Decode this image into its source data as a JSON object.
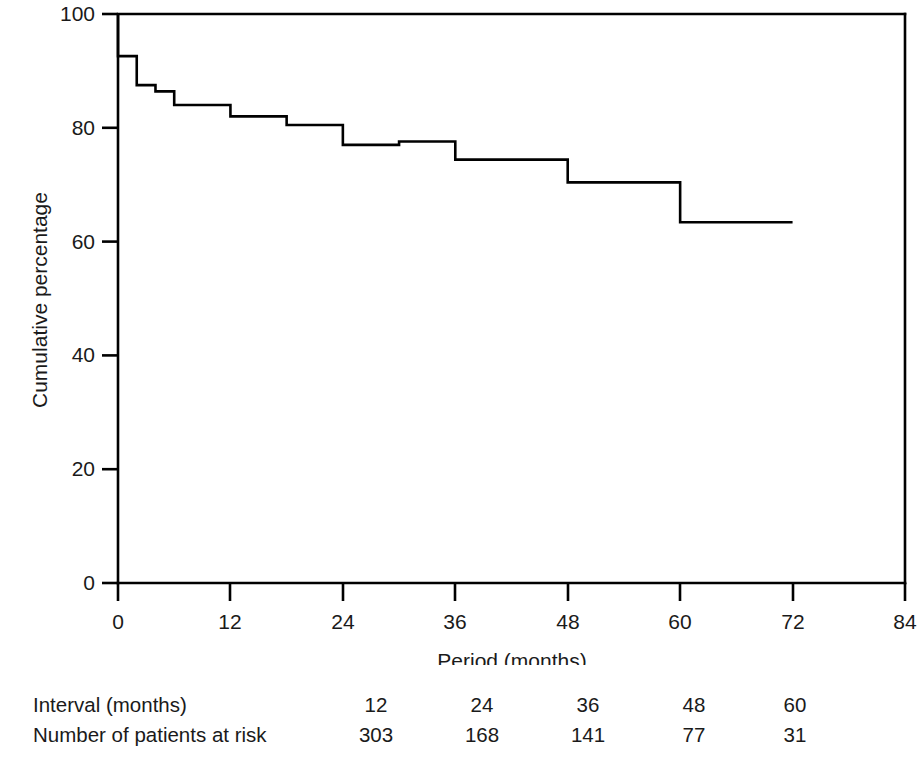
{
  "chart_data": {
    "type": "line",
    "subtype": "kaplan-meier-step",
    "title": "",
    "xlabel": "Period (months)",
    "ylabel": "Cumulative percentage",
    "xlim": [
      0,
      84
    ],
    "ylim": [
      0,
      100
    ],
    "xticks": [
      0,
      12,
      24,
      36,
      48,
      60,
      72,
      84
    ],
    "xtick_labels": [
      "0",
      "12",
      "24",
      "36",
      "48",
      "60",
      "72",
      "84"
    ],
    "yticks": [
      0,
      20,
      40,
      60,
      80,
      100
    ],
    "ytick_labels": [
      "0",
      "20",
      "40",
      "60",
      "80",
      "100"
    ],
    "grid": false,
    "legend": null,
    "line_color": "#000000",
    "line_width": 2.6,
    "series": [
      {
        "name": "Cumulative percentage",
        "step": "post",
        "x": [
          0,
          0,
          2,
          4,
          6,
          9,
          12,
          17,
          19,
          24,
          30,
          33,
          36,
          40,
          48,
          53,
          60,
          72
        ],
        "y": [
          100,
          92.6,
          92.6,
          87.5,
          87.5,
          84.0,
          84.0,
          82.0,
          80.5,
          80.5,
          77.0,
          77.6,
          77.6,
          74.4,
          74.4,
          70.4,
          70.4,
          63.4
        ],
        "points": [
          {
            "x": 0,
            "y": 100
          },
          {
            "x": 0,
            "y": 92.6
          },
          {
            "x": 2,
            "y": 92.6
          },
          {
            "x": 2,
            "y": 87.5
          },
          {
            "x": 4,
            "y": 87.5
          },
          {
            "x": 4,
            "y": 86.4
          },
          {
            "x": 6,
            "y": 86.4
          },
          {
            "x": 6,
            "y": 84.0
          },
          {
            "x": 12,
            "y": 84.0
          },
          {
            "x": 12,
            "y": 82.0
          },
          {
            "x": 18,
            "y": 82.0
          },
          {
            "x": 18,
            "y": 80.5
          },
          {
            "x": 24,
            "y": 80.5
          },
          {
            "x": 24,
            "y": 77.0
          },
          {
            "x": 30,
            "y": 77.0
          },
          {
            "x": 30,
            "y": 77.6
          },
          {
            "x": 36,
            "y": 77.6
          },
          {
            "x": 36,
            "y": 74.4
          },
          {
            "x": 48,
            "y": 74.4
          },
          {
            "x": 48,
            "y": 70.4
          },
          {
            "x": 60,
            "y": 70.4
          },
          {
            "x": 60,
            "y": 63.4
          },
          {
            "x": 72,
            "y": 63.4
          }
        ]
      }
    ]
  },
  "axes": {
    "y_axis_title": "Cumulative percentage",
    "x_axis_title": "Period (months)",
    "y_tick_labels": [
      "100",
      "80",
      "60",
      "40",
      "20",
      "0"
    ],
    "x_tick_labels": [
      "0",
      "12",
      "24",
      "36",
      "48",
      "60",
      "72",
      "84"
    ]
  },
  "risk_table": {
    "rows": [
      {
        "label": "Interval (months)",
        "values": [
          "12",
          "24",
          "36",
          "48",
          "60"
        ]
      },
      {
        "label": "Number of patients at risk",
        "values": [
          "303",
          "168",
          "141",
          "77",
          "31"
        ]
      }
    ]
  }
}
